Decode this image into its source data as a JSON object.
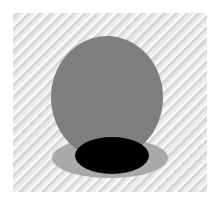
{
  "image": {
    "title": "3D sphere with cast shadow",
    "canvas": {
      "width_px": 219,
      "height_px": 205,
      "background_color": "#ffffff"
    },
    "panel": {
      "label": "scene panel",
      "left_px": 13,
      "top_px": 13,
      "width_px": 194,
      "height_px": 179,
      "background_color": "#e2e2e2",
      "texture": "diagonal-stripes-135deg",
      "texture_light_color": "#ffffff",
      "texture_dark_color": "#d0d0d0"
    },
    "objects": [
      {
        "name": "sphere",
        "shape": "circle",
        "color": "#7f7f7f",
        "left_px": 51,
        "top_px": 36,
        "width_px": 112,
        "height_px": 123
      },
      {
        "name": "ground-shadow",
        "shape": "ellipse",
        "color": "#a9a9a9",
        "left_px": 52,
        "top_px": 138,
        "width_px": 116,
        "height_px": 40
      },
      {
        "name": "contact-ellipse",
        "shape": "ellipse",
        "color": "#000000",
        "left_px": 75,
        "top_px": 137,
        "width_px": 74,
        "height_px": 37
      }
    ]
  }
}
